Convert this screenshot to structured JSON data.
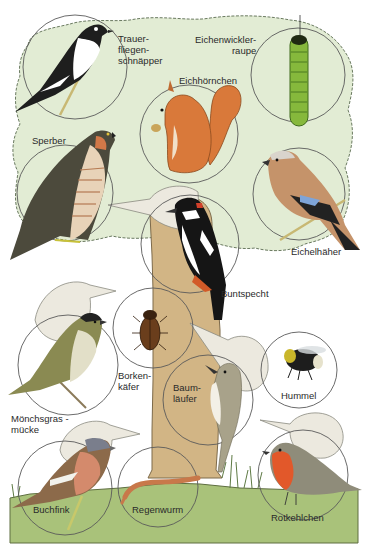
{
  "colors": {
    "canopy": "#e2ecd4",
    "canopy_outline": "#6a7a60",
    "trunk": "#d2b585",
    "trunk_outline": "#7d6a4a",
    "ground": "#a9c27a",
    "ground_outline": "#5e6e40",
    "circle_outline": "#5a5a5a",
    "ghost_bird": "#ece9df",
    "label_text": "#2a2a2a"
  },
  "animals": [
    {
      "id": "trauerfliegenschnaepper",
      "label": "Trauer-\nfliegen-\nschnäpper",
      "icon": "pied-flycatcher-icon",
      "circle": {
        "cx": 75,
        "cy": 67,
        "r": 52
      }
    },
    {
      "id": "eichenwicklerraupe",
      "label": "Eichenwickler-\n raupe",
      "icon": "caterpillar-icon",
      "circle": {
        "cx": 298,
        "cy": 75,
        "r": 47
      }
    },
    {
      "id": "eichhoernchen",
      "label": "Eichhörnchen",
      "icon": "squirrel-icon",
      "circle": {
        "cx": 189,
        "cy": 134,
        "r": 49
      }
    },
    {
      "id": "sperber",
      "label": "Sperber",
      "icon": "sparrowhawk-icon",
      "circle": {
        "cx": 65,
        "cy": 193,
        "r": 48
      }
    },
    {
      "id": "eichelhaeher",
      "label": "Eichelhäher",
      "icon": "jay-icon",
      "circle": {
        "cx": 299,
        "cy": 194,
        "r": 46
      }
    },
    {
      "id": "buntspecht",
      "label": "Buntspecht",
      "icon": "woodpecker-icon",
      "circle": {
        "cx": 190,
        "cy": 244,
        "r": 49
      }
    },
    {
      "id": "moenchsgrasmuecke",
      "label": "Mönchsgras -\nmücke",
      "icon": "blackcap-icon",
      "circle": {
        "cx": 68,
        "cy": 365,
        "r": 50
      }
    },
    {
      "id": "borkenkaefer",
      "label": "Borken-\nkäfer",
      "icon": "bark-beetle-icon",
      "circle": {
        "cx": 153,
        "cy": 328,
        "r": 40
      }
    },
    {
      "id": "baumlaeufer",
      "label": "Baum-\nläufer",
      "icon": "treecreeper-icon",
      "circle": {
        "cx": 208,
        "cy": 400,
        "r": 45
      }
    },
    {
      "id": "hummel",
      "label": "Hummel",
      "icon": "bumblebee-icon",
      "circle": {
        "cx": 299,
        "cy": 370,
        "r": 38
      }
    },
    {
      "id": "buchfink",
      "label": "Buchfink",
      "icon": "chaffinch-icon",
      "circle": {
        "cx": 65,
        "cy": 488,
        "r": 47
      }
    },
    {
      "id": "regenwurm",
      "label": "Regenwurm",
      "icon": "earthworm-icon",
      "circle": {
        "cx": 158,
        "cy": 487,
        "r": 40
      }
    },
    {
      "id": "rotkehlchen",
      "label": "Rotkehlchen",
      "icon": "robin-icon",
      "circle": {
        "cx": 303,
        "cy": 475,
        "r": 45
      }
    }
  ]
}
